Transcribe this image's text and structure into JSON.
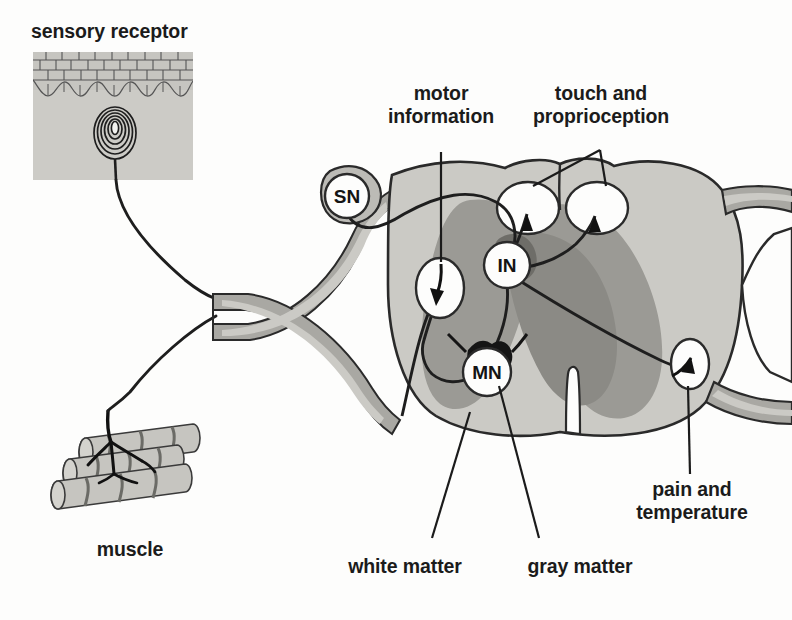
{
  "figure": {
    "colors": {
      "white_matter": "#c9c9c4",
      "gray_matter": "#9a9a95",
      "gray_matter_dark": "#8a8a85",
      "nerve_sheath_outer": "#a9a9a4",
      "nerve_sheath_inner": "#c9c9c4",
      "skin_fill": "#c9c9c4",
      "muscle_fill": "#c4c4bf",
      "outline": "#2a2a2a",
      "text": "#1b1b1b",
      "callout_fill": "#fdfdfc"
    }
  },
  "inset": {
    "title": "sensory receptor",
    "receptor_name": "pacinian-corpuscle",
    "layers": [
      "epidermis",
      "dermis"
    ]
  },
  "labels": {
    "sensory_receptor": "sensory receptor",
    "muscle": "muscle",
    "motor_information": "motor\ninformation",
    "touch_and_proprioception": "touch and\nproprioception",
    "pain_and_temperature": "pain and\ntemperature",
    "white_matter": "white matter",
    "gray_matter": "gray matter"
  },
  "neurons": [
    {
      "code": "SN",
      "name": "sensory-neuron",
      "cx": 347,
      "cy": 196
    },
    {
      "code": "IN",
      "name": "interneuron",
      "cx": 507,
      "cy": 265
    },
    {
      "code": "MN",
      "name": "motor-neuron",
      "cx": 487,
      "cy": 372
    }
  ],
  "callouts": [
    {
      "name": "motor-information-arrow",
      "direction": "down",
      "cx": 440,
      "cy": 288
    },
    {
      "name": "touch-proprioception-arrow-left",
      "direction": "up",
      "cx": 528,
      "cy": 208
    },
    {
      "name": "touch-proprioception-arrow-right",
      "direction": "up",
      "cx": 597,
      "cy": 208
    },
    {
      "name": "pain-temperature-arrow",
      "direction": "up",
      "cx": 690,
      "cy": 364
    }
  ]
}
